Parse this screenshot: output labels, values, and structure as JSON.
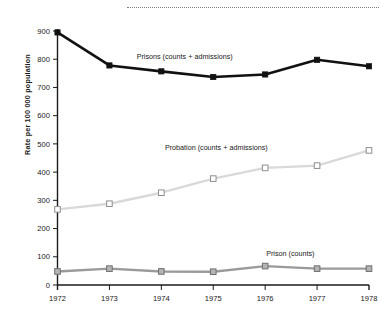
{
  "chart_data": {
    "type": "line",
    "title": "",
    "xlabel": "",
    "ylabel": "Rate per 100 000 population",
    "categories": [
      "1972",
      "1973",
      "1974",
      "1975",
      "1976",
      "1977",
      "1978"
    ],
    "x": [
      1972,
      1973,
      1974,
      1975,
      1976,
      1977,
      1978
    ],
    "xlim": [
      1972,
      1978
    ],
    "ylim": [
      0,
      900
    ],
    "y_ticks": [
      0,
      100,
      200,
      300,
      400,
      500,
      600,
      700,
      800,
      900
    ],
    "y_tick_labels": [
      "0",
      "100",
      "200",
      "300",
      "400",
      "500",
      "600",
      "700",
      "800",
      "900"
    ],
    "grid": false,
    "legend_position": "inline-annotations",
    "series": [
      {
        "name": "Prisons (counts + admissions)",
        "values": [
          895,
          778,
          757,
          737,
          746,
          798,
          775
        ],
        "color": "#111111",
        "marker": "filled-square",
        "label_x": 1974.45,
        "label_y": 800
      },
      {
        "name": "Probation (counts + admissions)",
        "values": [
          268,
          288,
          327,
          377,
          415,
          423,
          477
        ],
        "color": "#d9d9d9",
        "marker": "open-square",
        "label_x": 1976.05,
        "label_y": 478
      },
      {
        "name": "Prison (counts)",
        "values": [
          48,
          58,
          48,
          47,
          67,
          58,
          58
        ],
        "color": "#9a9a9a",
        "marker": "shaded-square",
        "label_x": 1976.95,
        "label_y": 103
      }
    ]
  }
}
